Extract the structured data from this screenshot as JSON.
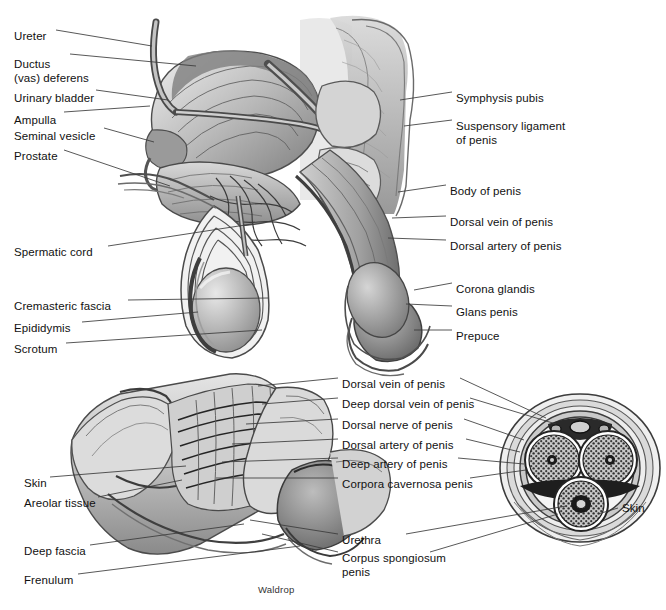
{
  "figure": {
    "signature": "Waldrop",
    "style": "grayscale medical illustration",
    "background_color": "#ffffff",
    "line_color": "#333333",
    "text_color": "#111111"
  },
  "panels": {
    "upper": {
      "name": "sagittal-section-of-male-pelvis",
      "left_labels": [
        {
          "id": "ureter",
          "text": "Ureter",
          "x": 14,
          "y": 30
        },
        {
          "id": "ductus-deferens",
          "text": "Ductus\n(vas) deferens",
          "x": 14,
          "y": 58
        },
        {
          "id": "urinary-bladder",
          "text": "Urinary bladder",
          "x": 14,
          "y": 92
        },
        {
          "id": "ampulla",
          "text": "Ampulla",
          "x": 14,
          "y": 114
        },
        {
          "id": "seminal-vesicle",
          "text": "Seminal vesicle",
          "x": 14,
          "y": 130
        },
        {
          "id": "prostate",
          "text": "Prostate",
          "x": 14,
          "y": 150
        },
        {
          "id": "spermatic-cord",
          "text": "Spermatic cord",
          "x": 14,
          "y": 246
        },
        {
          "id": "cremasteric-fascia",
          "text": "Cremasteric fascia",
          "x": 14,
          "y": 300
        },
        {
          "id": "epididymis",
          "text": "Epididymis",
          "x": 14,
          "y": 322
        },
        {
          "id": "scrotum",
          "text": "Scrotum",
          "x": 14,
          "y": 343
        }
      ],
      "right_labels": [
        {
          "id": "symphysis-pubis",
          "text": "Symphysis pubis",
          "x": 456,
          "y": 92
        },
        {
          "id": "suspensory-ligament",
          "text": "Suspensory ligament\nof penis",
          "x": 456,
          "y": 120
        },
        {
          "id": "body-of-penis",
          "text": "Body of penis",
          "x": 450,
          "y": 185
        },
        {
          "id": "dorsal-vein-of-penis",
          "text": "Dorsal vein of penis",
          "x": 450,
          "y": 216
        },
        {
          "id": "dorsal-artery-of-penis",
          "text": "Dorsal artery of penis",
          "x": 450,
          "y": 240
        },
        {
          "id": "corona-glandis",
          "text": "Corona glandis",
          "x": 456,
          "y": 283
        },
        {
          "id": "glans-penis",
          "text": "Glans penis",
          "x": 456,
          "y": 306
        },
        {
          "id": "prepuce",
          "text": "Prepuce",
          "x": 456,
          "y": 330
        }
      ]
    },
    "lower_left": {
      "name": "penis-dissection",
      "left_labels": [
        {
          "id": "skin",
          "text": "Skin",
          "x": 24,
          "y": 477
        },
        {
          "id": "areolar-tissue",
          "text": "Areolar tissue",
          "x": 24,
          "y": 497
        },
        {
          "id": "deep-fascia",
          "text": "Deep fascia",
          "x": 24,
          "y": 545
        },
        {
          "id": "frenulum",
          "text": "Frenulum",
          "x": 24,
          "y": 574
        }
      ]
    },
    "center": {
      "name": "shared-structure-labels",
      "labels": [
        {
          "id": "dorsal-vein-of-penis-2",
          "text": "Dorsal vein of penis",
          "x": 342,
          "y": 378
        },
        {
          "id": "deep-dorsal-vein-of-penis",
          "text": "Deep dorsal vein of penis",
          "x": 342,
          "y": 398
        },
        {
          "id": "dorsal-nerve-of-penis",
          "text": "Dorsal nerve of penis",
          "x": 342,
          "y": 419
        },
        {
          "id": "dorsal-artery-of-penis-2",
          "text": "Dorsal artery of penis",
          "x": 342,
          "y": 439
        },
        {
          "id": "deep-artery-of-penis",
          "text": "Deep artery of penis",
          "x": 342,
          "y": 458
        },
        {
          "id": "corpora-cavernosa-penis",
          "text": "Corpora cavernosa penis",
          "x": 342,
          "y": 478
        },
        {
          "id": "urethra",
          "text": "Urethra",
          "x": 342,
          "y": 534
        },
        {
          "id": "corpus-spongiosum-penis",
          "text": "Corpus spongiosum\npenis",
          "x": 342,
          "y": 552
        }
      ]
    },
    "cross_section": {
      "name": "penile-cross-section",
      "right_labels": [
        {
          "id": "skin-cross-section",
          "text": "Skin",
          "x": 622,
          "y": 508
        }
      ],
      "structures": [
        "corpus cavernosum (left)",
        "corpus cavernosum (right)",
        "corpus spongiosum",
        "urethra",
        "deep dorsal vein",
        "dorsal arteries",
        "dorsal nerves",
        "tunica albuginea",
        "deep fascia",
        "skin"
      ]
    }
  }
}
